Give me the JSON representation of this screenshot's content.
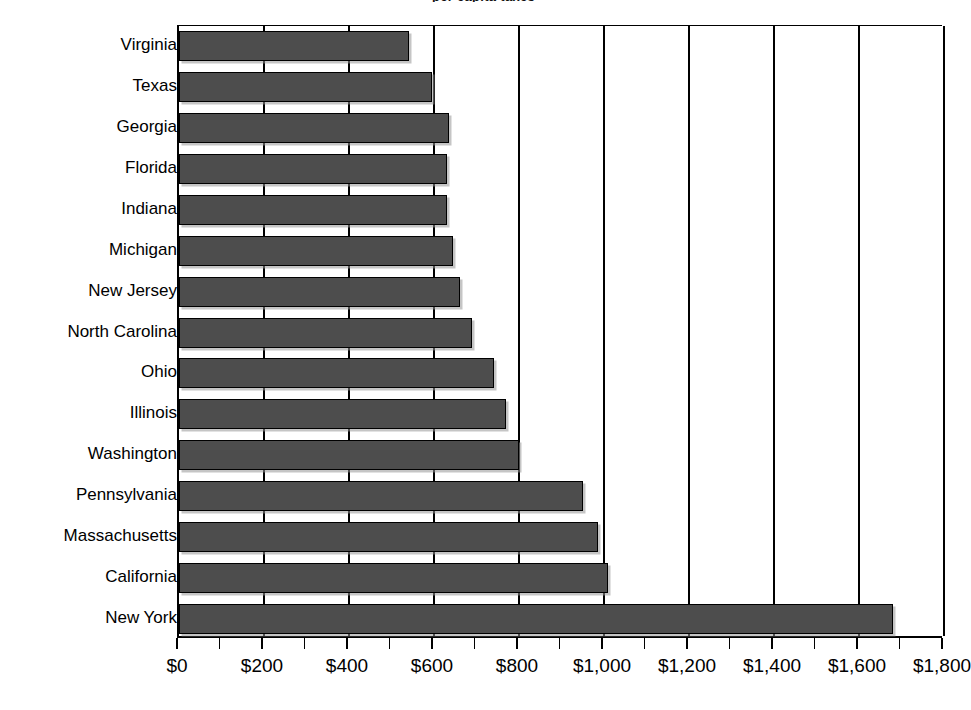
{
  "chart_data": {
    "type": "bar",
    "orientation": "horizontal",
    "title": "per capita taxes",
    "title_clipped": true,
    "categories": [
      "Virginia",
      "Texas",
      "Georgia",
      "Florida",
      "Indiana",
      "Michigan",
      "New Jersey",
      "North Carolina",
      "Ohio",
      "Illinois",
      "Washington",
      "Pennsylvania",
      "Massachusetts",
      "California",
      "New York"
    ],
    "values": [
      540,
      595,
      635,
      630,
      630,
      645,
      660,
      690,
      740,
      770,
      800,
      950,
      985,
      1010,
      1680
    ],
    "xlabel": "",
    "ylabel": "",
    "xlim": [
      0,
      1800
    ],
    "x_tick_values": [
      0,
      200,
      400,
      600,
      800,
      1000,
      1200,
      1400,
      1600,
      1800
    ],
    "x_tick_labels": [
      "$0",
      "$200",
      "$400",
      "$600",
      "$800",
      "$1,000",
      "$1,200",
      "$1,400",
      "$1,600",
      "$1,800"
    ],
    "minor_tick_interval": 100,
    "grid": "vertical-major-only",
    "legend": "none",
    "bar_color": "#4d4d4d",
    "bar_border_color": "#000000",
    "background_color": "#ffffff",
    "axis_color": "#000000"
  }
}
